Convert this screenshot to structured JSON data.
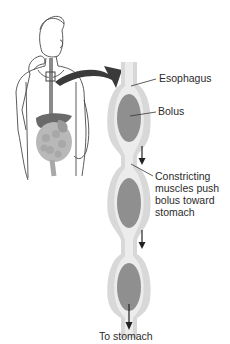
{
  "figure": {
    "labels": {
      "esophagus": "Esophagus",
      "bolus": "Bolus",
      "constricting": "Constricting\nmuscles push\nbolus toward\nstomach",
      "to_stomach": "To stomach"
    },
    "colors": {
      "tube_outer": "#d6d6d6",
      "tube_inner": "#ebebeb",
      "bolus": "#8f8f8f",
      "arrow": "#3a3a3a",
      "line_art": "#444444",
      "liver": "#6a6a6a",
      "intestine": "#b5b5b5"
    },
    "elements": [
      "person-outline",
      "digestive-tract-inset",
      "curved-callout-arrow",
      "esophagus-tube",
      "bolus-1",
      "bolus-2",
      "bolus-3",
      "downward-arrow-1",
      "downward-arrow-2",
      "downward-arrow-3"
    ]
  }
}
